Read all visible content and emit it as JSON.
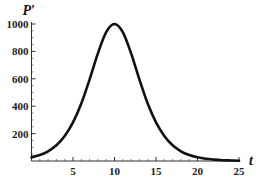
{
  "chart_data": {
    "type": "line",
    "title": "",
    "xlabel": "t",
    "ylabel": "P′",
    "xlim": [
      0,
      25
    ],
    "ylim": [
      0,
      1000
    ],
    "xticks": [
      5,
      10,
      15,
      20,
      25
    ],
    "yticks": [
      200,
      400,
      600,
      800,
      1000
    ],
    "xtick_labels": [
      "5",
      "10",
      "15",
      "20",
      "25"
    ],
    "ytick_labels": [
      "200",
      "400",
      "600",
      "800",
      "1000"
    ],
    "x_minor_step": 1,
    "y_minor_step": 50,
    "grid": false,
    "legend": "none",
    "series": [
      {
        "name": "P′(t)",
        "color": "#111111",
        "x": [
          0,
          1,
          2,
          3,
          4,
          5,
          6,
          7,
          8,
          9,
          10,
          11,
          12,
          13,
          14,
          15,
          16,
          17,
          18,
          19,
          20,
          21,
          22,
          23,
          24,
          25
        ],
        "values": [
          27,
          44,
          71,
          115,
          183,
          282,
          420,
          596,
          786,
          941,
          1000,
          941,
          786,
          596,
          420,
          282,
          183,
          115,
          71,
          44,
          27,
          16,
          10,
          6,
          4,
          2
        ]
      }
    ]
  }
}
